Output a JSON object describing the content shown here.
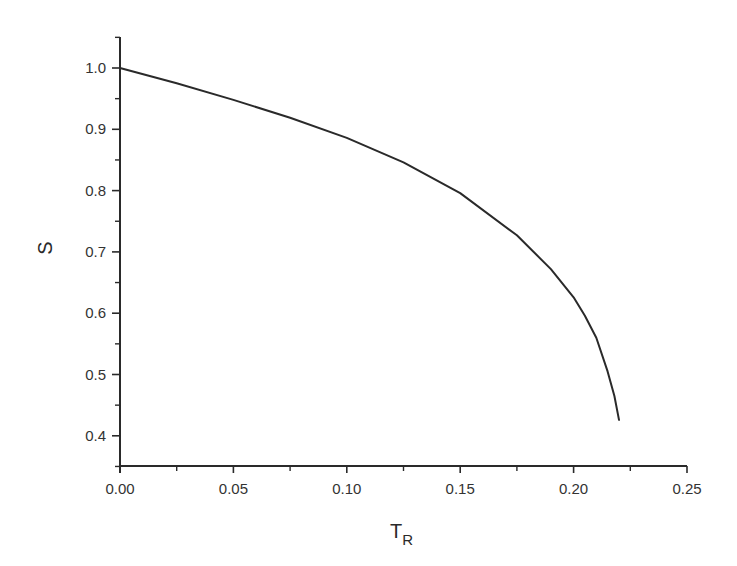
{
  "chart_data": {
    "type": "line",
    "title": "",
    "xlabel": "T_R",
    "xlabel_main": "T",
    "xlabel_sub": "R",
    "ylabel": "S",
    "xlim": [
      0.0,
      0.25
    ],
    "ylim": [
      0.35,
      1.05
    ],
    "grid": false,
    "legend": null,
    "x_ticks": [
      "0.00",
      "0.05",
      "0.10",
      "0.15",
      "0.20",
      "0.25"
    ],
    "x_tick_values": [
      0.0,
      0.05,
      0.1,
      0.15,
      0.2,
      0.25
    ],
    "x_minor_tick_values": [
      0.025,
      0.075,
      0.125,
      0.175,
      0.225
    ],
    "y_ticks": [
      "0.4",
      "0.5",
      "0.6",
      "0.7",
      "0.8",
      "0.9",
      "1.0"
    ],
    "y_tick_values": [
      0.4,
      0.5,
      0.6,
      0.7,
      0.8,
      0.9,
      1.0
    ],
    "y_minor_tick_values": [
      0.35,
      0.45,
      0.55,
      0.65,
      0.75,
      0.85,
      0.95,
      1.05
    ],
    "series": [
      {
        "name": "S",
        "color": "#2a2a2a",
        "x": [
          0.0,
          0.025,
          0.05,
          0.075,
          0.1,
          0.125,
          0.15,
          0.175,
          0.19,
          0.2,
          0.205,
          0.21,
          0.215,
          0.218,
          0.22
        ],
        "y": [
          1.0,
          0.975,
          0.948,
          0.919,
          0.886,
          0.846,
          0.796,
          0.727,
          0.672,
          0.626,
          0.596,
          0.56,
          0.505,
          0.465,
          0.426
        ]
      }
    ]
  }
}
